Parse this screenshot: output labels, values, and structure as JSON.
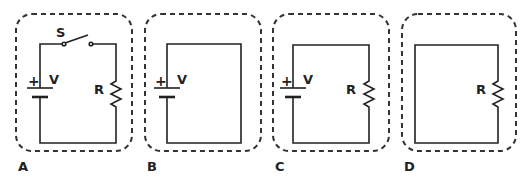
{
  "panels": [
    {
      "id": "A",
      "label": "A",
      "components": [
        "battery",
        "switch",
        "resistor"
      ],
      "battery_label": "V",
      "battery_sign": "+",
      "switch_label": "S",
      "resistor_label": "R",
      "switch_state": "open"
    },
    {
      "id": "B",
      "label": "B",
      "components": [
        "battery"
      ],
      "battery_label": "V",
      "battery_sign": "+"
    },
    {
      "id": "C",
      "label": "C",
      "components": [
        "battery",
        "resistor"
      ],
      "battery_label": "V",
      "battery_sign": "+",
      "resistor_label": "R"
    },
    {
      "id": "D",
      "label": "D",
      "components": [
        "resistor"
      ],
      "resistor_label": "R"
    }
  ],
  "colors": {
    "line": "#222222",
    "dash": "#333333",
    "background": "#ffffff"
  }
}
